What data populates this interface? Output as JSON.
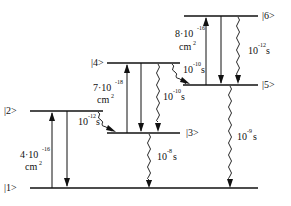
{
  "diagram": {
    "type": "energy-level-diagram",
    "levels": [
      {
        "id": "1",
        "label": "|1>"
      },
      {
        "id": "2",
        "label": "|2>"
      },
      {
        "id": "3",
        "label": "|3>"
      },
      {
        "id": "4",
        "label": "|4>"
      },
      {
        "id": "5",
        "label": "|5>"
      },
      {
        "id": "6",
        "label": "|6>"
      }
    ],
    "absorptions": [
      {
        "from": "1",
        "to": "2",
        "mantissa": "4·10",
        "exp": "-16",
        "unit": "cm",
        "unit_exp": "2"
      },
      {
        "from": "3",
        "to": "4",
        "mantissa": "7·10",
        "exp": "-18",
        "unit": "cm",
        "unit_exp": "2"
      },
      {
        "from": "5",
        "to": "6",
        "mantissa": "8·10",
        "exp": "-16",
        "unit": "cm",
        "unit_exp": "2"
      }
    ],
    "relaxations": [
      {
        "from": "2",
        "to": "3",
        "base": "10",
        "exp": "-12",
        "unit": "s"
      },
      {
        "from": "4",
        "to": "5",
        "base": "10",
        "exp": "-10",
        "unit": "s"
      },
      {
        "from": "4",
        "to": "3",
        "base": "10",
        "exp": "-10",
        "unit": "s"
      },
      {
        "from": "3",
        "to": "1",
        "base": "10",
        "exp": "-8",
        "unit": "s"
      },
      {
        "from": "6",
        "to": "5",
        "base": "10",
        "exp": "-12",
        "unit": "s"
      },
      {
        "from": "5",
        "to": "1",
        "base": "10",
        "exp": "-9",
        "unit": "s"
      }
    ]
  }
}
